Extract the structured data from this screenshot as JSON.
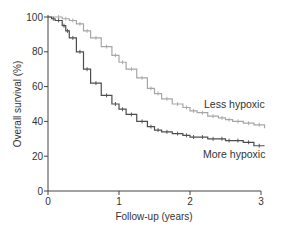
{
  "chart_data": {
    "type": "line",
    "subtype": "kaplan-meier",
    "title": "",
    "xlabel": "Follow-up (years)",
    "ylabel": "Overall survival (%)",
    "xlim": [
      0,
      3
    ],
    "ylim": [
      0,
      100
    ],
    "xticks": [
      0,
      1,
      2,
      3
    ],
    "yticks": [
      0,
      20,
      40,
      60,
      80,
      100
    ],
    "grid": false,
    "legend": "inline labels",
    "series": [
      {
        "name": "Less hypoxic",
        "color": "#a6a6a6",
        "x": [
          0,
          0.1,
          0.2,
          0.3,
          0.4,
          0.5,
          0.6,
          0.75,
          0.9,
          1.0,
          1.1,
          1.25,
          1.4,
          1.5,
          1.6,
          1.75,
          1.9,
          2.0,
          2.1,
          2.25,
          2.4,
          2.5,
          2.6,
          2.75,
          2.9,
          3.05
        ],
        "values": [
          100,
          100,
          99,
          98,
          96,
          92,
          88,
          83,
          78,
          74,
          70,
          65,
          59,
          56,
          53,
          50,
          48,
          46,
          45,
          43,
          42,
          41,
          40,
          39,
          38,
          36
        ]
      },
      {
        "name": "More hypoxic",
        "color": "#4d4d4d",
        "x": [
          0,
          0.05,
          0.1,
          0.2,
          0.25,
          0.3,
          0.4,
          0.5,
          0.6,
          0.75,
          0.9,
          1.0,
          1.1,
          1.25,
          1.4,
          1.5,
          1.6,
          1.75,
          1.9,
          2.0,
          2.1,
          2.25,
          2.4,
          2.5,
          2.6,
          2.75,
          2.9,
          3.05
        ],
        "values": [
          100,
          99,
          98,
          95,
          92,
          88,
          80,
          70,
          62,
          55,
          50,
          47,
          44,
          40,
          37,
          35,
          34,
          33,
          32,
          31,
          31,
          30,
          30,
          29,
          29,
          28,
          26,
          26
        ]
      }
    ]
  },
  "labels": {
    "less": "Less hypoxic",
    "more": "More hypoxic"
  }
}
